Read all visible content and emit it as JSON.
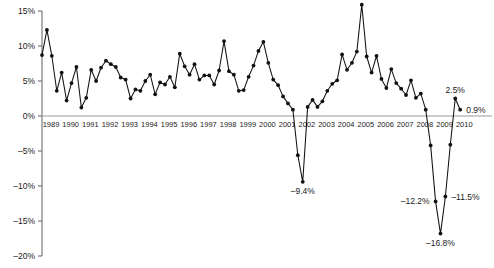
{
  "chart_data": {
    "type": "line",
    "title": "",
    "subtitle": "",
    "xlabel": "",
    "ylabel": "",
    "ylim": [
      -20,
      15
    ],
    "xlim": [
      1989,
      2010.75
    ],
    "grid": false,
    "legend": null,
    "y_ticks": [
      15,
      10,
      5,
      0,
      -5,
      -10,
      -15,
      -20
    ],
    "y_tick_labels": [
      "15%",
      "10%",
      "5%",
      "0%",
      "–5%",
      "–10%",
      "–15%",
      "–20%"
    ],
    "x_ticks": [
      1989,
      1990,
      1991,
      1992,
      1993,
      1994,
      1995,
      1996,
      1997,
      1998,
      1999,
      2000,
      2001,
      2002,
      2003,
      2004,
      2005,
      2006,
      2007,
      2008,
      2009,
      2010
    ],
    "x_tick_labels": [
      "1989",
      "1990",
      "1991",
      "1992",
      "1993",
      "1994",
      "1995",
      "1996",
      "1997",
      "1998",
      "1999",
      "2000",
      "2001",
      "2002",
      "2003",
      "2004",
      "2005",
      "2006",
      "2007",
      "2008",
      "2009",
      "2010"
    ],
    "series": [
      {
        "name": "percent-change",
        "x": [
          1989.0,
          1989.25,
          1989.5,
          1989.75,
          1990.0,
          1990.25,
          1990.5,
          1990.75,
          1991.0,
          1991.25,
          1991.5,
          1991.75,
          1992.0,
          1992.25,
          1992.5,
          1992.75,
          1993.0,
          1993.25,
          1993.5,
          1993.75,
          1994.0,
          1994.25,
          1994.5,
          1994.75,
          1995.0,
          1995.25,
          1995.5,
          1995.75,
          1996.0,
          1996.25,
          1996.5,
          1996.75,
          1997.0,
          1997.25,
          1997.5,
          1997.75,
          1998.0,
          1998.25,
          1998.5,
          1998.75,
          1999.0,
          1999.25,
          1999.5,
          1999.75,
          2000.0,
          2000.25,
          2000.5,
          2000.75,
          2001.0,
          2001.25,
          2001.5,
          2001.75,
          2002.0,
          2002.25,
          2002.5,
          2002.75,
          2003.0,
          2003.25,
          2003.5,
          2003.75,
          2004.0,
          2004.25,
          2004.5,
          2004.75,
          2005.0,
          2005.25,
          2005.5,
          2005.75,
          2006.0,
          2006.25,
          2006.5,
          2006.75,
          2007.0,
          2007.25,
          2007.5,
          2007.75,
          2008.0,
          2008.25,
          2008.5,
          2008.75,
          2009.0,
          2009.25,
          2009.5,
          2009.75,
          2010.0,
          2010.25
        ],
        "values": [
          8.7,
          12.3,
          8.6,
          3.6,
          6.2,
          2.2,
          4.7,
          7.0,
          1.2,
          2.6,
          6.6,
          5.0,
          6.9,
          7.9,
          7.4,
          7.0,
          5.5,
          5.2,
          2.5,
          3.8,
          3.6,
          5.0,
          5.9,
          3.1,
          4.8,
          4.5,
          5.6,
          4.1,
          8.9,
          7.1,
          5.9,
          7.4,
          5.2,
          5.8,
          5.8,
          4.5,
          6.5,
          10.7,
          6.4,
          5.9,
          3.6,
          3.7,
          5.6,
          7.2,
          9.3,
          10.6,
          7.6,
          5.2,
          4.4,
          2.8,
          1.8,
          0.9,
          -5.6,
          -9.4,
          1.3,
          2.3,
          1.3,
          2.1,
          3.6,
          4.6,
          5.1,
          8.8,
          6.6,
          7.6,
          9.2,
          15.9,
          8.5,
          6.2,
          8.6,
          5.3,
          4.0,
          6.7,
          4.7,
          3.9,
          3.0,
          5.1,
          2.6,
          3.2,
          0.9,
          -4.2,
          -12.2,
          -16.8,
          -11.5,
          -4.1,
          2.5,
          0.9
        ]
      }
    ],
    "annotations": [
      {
        "label": "15.9%",
        "x": 2005.25,
        "y": 15.9,
        "position": "above"
      },
      {
        "label": "–9.4%",
        "x": 2002.25,
        "y": -9.4,
        "position": "below"
      },
      {
        "label": "–12.2%",
        "x": 2009.0,
        "y": -12.2,
        "position": "left"
      },
      {
        "label": "–16.8%",
        "x": 2009.25,
        "y": -16.8,
        "position": "below"
      },
      {
        "label": "–11.5%",
        "x": 2009.5,
        "y": -11.5,
        "position": "right"
      },
      {
        "label": "2.5%",
        "x": 2010.0,
        "y": 2.5,
        "position": "above"
      },
      {
        "label": "0.9%",
        "x": 2010.25,
        "y": 0.9,
        "position": "right"
      }
    ],
    "colors": {
      "line": "#111111",
      "marker": "#111111",
      "axis": "#6e6e6e",
      "zero_line": "#9a9a9a",
      "background": "#ffffff",
      "text": "#1a1a1a"
    }
  }
}
